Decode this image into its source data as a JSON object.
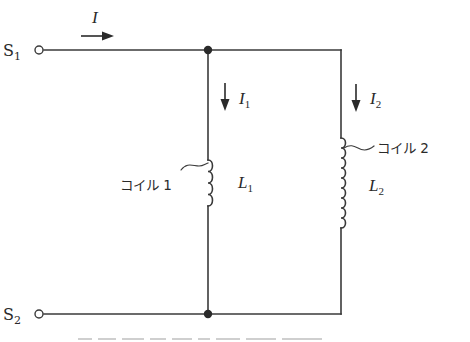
{
  "diagram": {
    "type": "parallel-inductor-circuit",
    "stroke_color": "#3a3a3a",
    "terminals": [
      {
        "id": "S1",
        "label": "S",
        "sub": "1",
        "x": 39,
        "y": 50
      },
      {
        "id": "S2",
        "label": "S",
        "sub": "2",
        "x": 39,
        "y": 313
      }
    ],
    "junctions": [
      {
        "x": 208,
        "y": 50
      },
      {
        "x": 208,
        "y": 314
      }
    ],
    "currents": [
      {
        "id": "I",
        "label": "I",
        "sub": "",
        "direction": "right"
      },
      {
        "id": "I1",
        "label": "I",
        "sub": "1",
        "direction": "down"
      },
      {
        "id": "I2",
        "label": "I",
        "sub": "2",
        "direction": "down"
      }
    ],
    "coils": [
      {
        "id": "coil1",
        "name": "コイル 1",
        "inductance_label": "L",
        "inductance_sub": "1",
        "turns": 4
      },
      {
        "id": "coil2",
        "name": "コイル 2",
        "inductance_label": "L",
        "inductance_sub": "2",
        "turns": 9
      }
    ]
  },
  "labels": {
    "S1_main": "S",
    "S1_sub": "1",
    "S2_main": "S",
    "S2_sub": "2",
    "I_main": "I",
    "I1_main": "I",
    "I1_sub": "1",
    "I2_main": "I",
    "I2_sub": "2",
    "L1_main": "L",
    "L1_sub": "1",
    "L2_main": "L",
    "L2_sub": "2",
    "coil1_name": "コイル 1",
    "coil2_name": "コイル 2"
  },
  "caption": {
    "visible": "cropped — text not legible"
  }
}
